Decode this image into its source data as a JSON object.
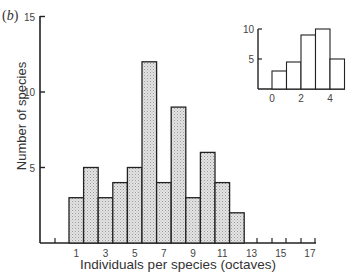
{
  "panel_label": {
    "open": "(",
    "letter": "b",
    "close": ")"
  },
  "chart_data": [
    {
      "type": "bar",
      "title": "",
      "xlabel": "Individuals per species (octaves)",
      "ylabel": "Number of species",
      "x_tick_labels": [
        "1",
        "3",
        "5",
        "7",
        "9",
        "11",
        "13",
        "15",
        "17"
      ],
      "y_tick_labels": [
        "5",
        "10",
        "15"
      ],
      "ylim": [
        0,
        15
      ],
      "xlim": [
        -1,
        17.5
      ],
      "categories": [
        1,
        2,
        3,
        4,
        5,
        6,
        7,
        8,
        9,
        10,
        11,
        12
      ],
      "values": [
        3,
        5,
        3,
        4,
        5,
        12,
        4,
        9,
        3,
        6,
        4,
        2
      ],
      "empty_ticks": [
        0,
        13,
        14,
        15,
        16,
        17
      ],
      "grid": false,
      "legend": null,
      "bar_fill": "stippled light gray"
    },
    {
      "type": "bar",
      "title": "",
      "role": "inset",
      "xlabel": "",
      "ylabel": "",
      "x_tick_labels": [
        "0",
        "2",
        "4"
      ],
      "y_tick_labels": [
        "5",
        "10"
      ],
      "ylim": [
        0,
        10
      ],
      "categories": [
        0,
        1,
        2,
        3,
        4
      ],
      "values": [
        3,
        4.5,
        9,
        10,
        5
      ],
      "grid": false,
      "legend": null,
      "bar_fill": "white"
    }
  ],
  "colors": {
    "axis": "#222222",
    "bar_stroke": "#222222",
    "bar_fill_main": "#d9d9d9",
    "bar_fill_inset": "#ffffff"
  }
}
